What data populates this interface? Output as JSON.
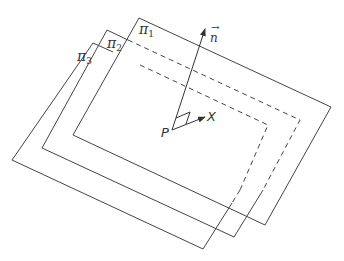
{
  "diagram": {
    "colors": {
      "line": "#444444",
      "background": "#ffffff"
    },
    "planes": [
      {
        "name": "π",
        "index": "1",
        "label_pos": [
          140,
          24
        ]
      },
      {
        "name": "π",
        "index": "2",
        "label_pos": [
          108,
          37
        ]
      },
      {
        "name": "π",
        "index": "3",
        "label_pos": [
          78,
          49
        ]
      }
    ],
    "point": {
      "label": "P"
    },
    "normal_vector": {
      "label": "n",
      "accent": "→"
    },
    "direction": {
      "label": "X"
    }
  }
}
